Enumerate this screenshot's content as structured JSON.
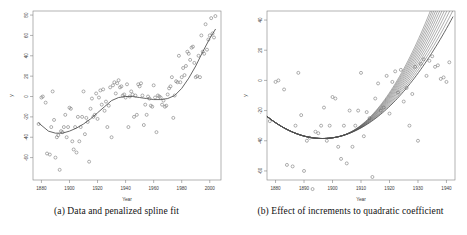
{
  "figure": {
    "panels": [
      {
        "id": "a",
        "caption": "(a) Data and penalized spline fit",
        "xlabel": "Year",
        "ylabel": "y"
      },
      {
        "id": "b",
        "caption": "(b) Effect of increments to quadratic coefficient",
        "xlabel": "Year",
        "ylabel": "y"
      }
    ]
  },
  "chart_data": [
    {
      "type": "scatter",
      "title": "(a) Data and penalized spline fit",
      "xlabel": "Year",
      "ylabel": "y",
      "xlim": [
        1874,
        2008
      ],
      "ylim": [
        -82,
        84
      ],
      "xticks": [
        1880,
        1900,
        1920,
        1940,
        1960,
        1980,
        2000
      ],
      "yticks": [
        -60,
        -40,
        -20,
        0,
        20,
        40,
        60,
        80
      ],
      "grid": false,
      "legend": "none",
      "series": [
        {
          "name": "observations",
          "marker": "open-circle",
          "x": [
            1878,
            1880,
            1881,
            1883,
            1884,
            1886,
            1887,
            1888,
            1889,
            1890,
            1891,
            1892,
            1893,
            1894,
            1895,
            1896,
            1897,
            1898,
            1899,
            1900,
            1901,
            1902,
            1903,
            1904,
            1905,
            1906,
            1907,
            1908,
            1909,
            1910,
            1911,
            1912,
            1913,
            1914,
            1915,
            1916,
            1917,
            1918,
            1919,
            1920,
            1921,
            1922,
            1923,
            1924,
            1925,
            1926,
            1927,
            1928,
            1929,
            1930,
            1931,
            1932,
            1933,
            1934,
            1935,
            1936,
            1937,
            1938,
            1939,
            1940,
            1941,
            1942,
            1943,
            1944,
            1945,
            1946,
            1947,
            1948,
            1949,
            1950,
            1951,
            1952,
            1953,
            1954,
            1955,
            1956,
            1957,
            1958,
            1959,
            1960,
            1961,
            1962,
            1963,
            1964,
            1965,
            1966,
            1967,
            1968,
            1969,
            1970,
            1971,
            1972,
            1973,
            1974,
            1975,
            1976,
            1977,
            1978,
            1979,
            1980,
            1981,
            1982,
            1983,
            1984,
            1985,
            1986,
            1987,
            1988,
            1989,
            1990,
            1991,
            1992,
            1993,
            1994,
            1995,
            1996,
            1997,
            1998,
            1999,
            2000,
            2001,
            2002,
            2003,
            2004
          ],
          "y": [
            -27,
            -1,
            0,
            -6,
            -56,
            -57,
            -30,
            5,
            -23,
            -60,
            -40,
            -38,
            -72,
            -34,
            -35,
            -30,
            -18,
            -40,
            -30,
            -11,
            -12,
            -44,
            -52,
            -30,
            -55,
            -20,
            -44,
            -30,
            -20,
            5,
            -37,
            -21,
            -25,
            -64,
            -12,
            -2,
            -20,
            -18,
            3,
            -22,
            -1,
            6,
            -8,
            7,
            -14,
            -5,
            -30,
            -9,
            9,
            -40,
            11,
            14,
            3,
            13,
            16,
            9,
            10,
            1,
            2,
            -1,
            12,
            -30,
            0,
            5,
            2,
            -20,
            1,
            -18,
            12,
            10,
            13,
            1,
            -28,
            -8,
            -18,
            0,
            -2,
            -9,
            -10,
            11,
            -1,
            -35,
            1,
            0,
            -1,
            -8,
            -4,
            -10,
            -9,
            2,
            8,
            10,
            19,
            -21,
            1,
            15,
            14,
            40,
            14,
            19,
            28,
            21,
            30,
            44,
            42,
            36,
            48,
            49,
            33,
            19,
            20,
            40,
            19,
            60,
            44,
            42,
            71,
            46,
            56,
            60,
            77,
            62,
            58,
            79
          ]
        },
        {
          "name": "penalized spline fit",
          "marker": "line",
          "x": [
            1878,
            1885,
            1890,
            1895,
            1900,
            1905,
            1910,
            1915,
            1920,
            1925,
            1930,
            1935,
            1940,
            1945,
            1950,
            1955,
            1960,
            1965,
            1970,
            1975,
            1980,
            1985,
            1990,
            1995,
            2000,
            2004
          ],
          "y": [
            -26,
            -34,
            -36,
            -36,
            -34,
            -31,
            -27,
            -22,
            -16,
            -10,
            -4,
            -1,
            0,
            0,
            -1,
            -2,
            -3,
            -3,
            -2,
            1,
            8,
            18,
            30,
            44,
            57,
            66
          ]
        }
      ]
    },
    {
      "type": "line",
      "title": "(b) Effect of increments to quadratic coefficient",
      "xlabel": "Year",
      "ylabel": "y",
      "xlim": [
        1877,
        1943
      ],
      "ylim": [
        -66,
        46
      ],
      "xticks": [
        1880,
        1890,
        1900,
        1910,
        1920,
        1930,
        1940
      ],
      "yticks": [
        -60,
        -40,
        -20,
        0,
        20,
        40
      ],
      "grid": false,
      "legend": "none",
      "series": [
        {
          "name": "observations",
          "marker": "open-circle",
          "x": [
            1878,
            1880,
            1881,
            1883,
            1884,
            1886,
            1887,
            1888,
            1889,
            1890,
            1891,
            1892,
            1893,
            1894,
            1895,
            1896,
            1897,
            1898,
            1899,
            1900,
            1901,
            1902,
            1903,
            1904,
            1905,
            1906,
            1907,
            1908,
            1909,
            1910,
            1911,
            1912,
            1913,
            1914,
            1915,
            1916,
            1917,
            1918,
            1919,
            1920,
            1921,
            1922,
            1923,
            1924,
            1925,
            1926,
            1927,
            1928,
            1929,
            1930,
            1931,
            1932,
            1933,
            1934,
            1935,
            1936,
            1937,
            1938,
            1939,
            1940,
            1941
          ],
          "y": [
            -27,
            -1,
            0,
            -6,
            -56,
            -57,
            -30,
            5,
            -23,
            -60,
            -40,
            -38,
            -72,
            -34,
            -35,
            -30,
            -18,
            -40,
            -30,
            -11,
            -12,
            -44,
            -52,
            -30,
            -55,
            -20,
            -44,
            -30,
            -20,
            5,
            -37,
            -21,
            -25,
            -64,
            -12,
            -2,
            -20,
            -18,
            3,
            -22,
            -1,
            6,
            -8,
            7,
            -14,
            -5,
            -30,
            -9,
            9,
            -40,
            11,
            14,
            3,
            13,
            16,
            9,
            10,
            1,
            2,
            -1,
            12
          ]
        },
        {
          "name": "base quadratic fit",
          "marker": "line",
          "increment": 0
        },
        {
          "name": "incremented quadratic fits",
          "marker": "fan-of-lines",
          "count": 11,
          "note": "curves fan upward from the base fit with increasing quadratic coefficient"
        }
      ]
    }
  ]
}
